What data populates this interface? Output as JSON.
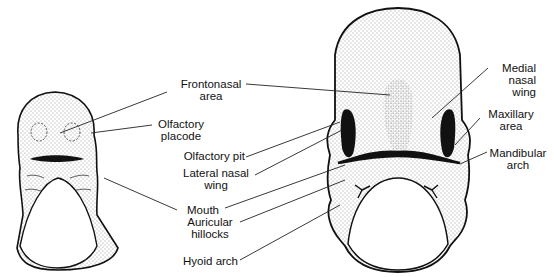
{
  "figure": {
    "labels": {
      "frontonasal_area": {
        "line1": "Frontonasal",
        "line2": "area"
      },
      "olfactory_placode": {
        "line1": "Olfactory",
        "line2": "placode"
      },
      "olfactory_pit": "Olfactory pit",
      "lateral_nasal_wing": {
        "line1": "Lateral nasal",
        "line2": "wing"
      },
      "mouth": "Mouth",
      "auricular_hillocks": {
        "line1": "Auricular",
        "line2": "hillocks"
      },
      "hyoid_arch": "Hyoid arch",
      "medial_nasal_wing": {
        "line1": "Medial",
        "line2": "nasal",
        "line3": "wing"
      },
      "maxillary_area": {
        "line1": "Maxillary",
        "line2": "area"
      },
      "mandibular_arch": {
        "line1": "Mandibular",
        "line2": "arch"
      }
    }
  }
}
